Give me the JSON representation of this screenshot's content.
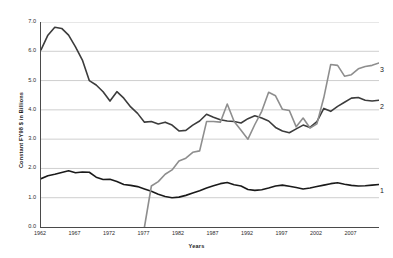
{
  "chart_data": {
    "type": "line",
    "title": "",
    "xlabel": "Years",
    "ylabel": "Constant FY98 $ in Billions",
    "xlim": [
      1962,
      2011
    ],
    "ylim": [
      0.0,
      7.0
    ],
    "grid": true,
    "legend_position": "right-inline-end-labels",
    "xticks": [
      "1962",
      "1967",
      "1972",
      "1977",
      "1982",
      "1987",
      "1992",
      "1997",
      "2002",
      "2007"
    ],
    "xtick_values": [
      1962,
      1967,
      1972,
      1977,
      1982,
      1987,
      1992,
      1997,
      2002,
      2007
    ],
    "yticks": [
      "0.0",
      "1.0",
      "2.0",
      "3.0",
      "4.0",
      "5.0",
      "6.0",
      "7.0"
    ],
    "ytick_values": [
      0.0,
      1.0,
      2.0,
      3.0,
      4.0,
      5.0,
      6.0,
      7.0
    ],
    "x": [
      1962,
      1963,
      1964,
      1965,
      1966,
      1967,
      1968,
      1969,
      1970,
      1971,
      1972,
      1973,
      1974,
      1975,
      1976,
      1977,
      1978,
      1979,
      1980,
      1981,
      1982,
      1983,
      1984,
      1985,
      1986,
      1987,
      1988,
      1989,
      1990,
      1991,
      1992,
      1993,
      1994,
      1995,
      1996,
      1997,
      1998,
      1999,
      2000,
      2001,
      2002,
      2003,
      2004,
      2005,
      2006,
      2007,
      2008,
      2009,
      2010,
      2011
    ],
    "series": [
      {
        "name": "1",
        "label": "1",
        "color": "#1a1a1a",
        "width": 1.6,
        "values": [
          1.65,
          1.75,
          1.8,
          1.86,
          1.92,
          1.85,
          1.88,
          1.87,
          1.7,
          1.62,
          1.63,
          1.55,
          1.45,
          1.42,
          1.38,
          1.3,
          1.22,
          1.12,
          1.04,
          1.0,
          1.02,
          1.08,
          1.16,
          1.24,
          1.33,
          1.41,
          1.48,
          1.52,
          1.44,
          1.4,
          1.28,
          1.25,
          1.27,
          1.33,
          1.4,
          1.43,
          1.39,
          1.35,
          1.3,
          1.33,
          1.38,
          1.43,
          1.48,
          1.51,
          1.46,
          1.42,
          1.4,
          1.41,
          1.43,
          1.45
        ]
      },
      {
        "name": "2",
        "label": "2",
        "color": "#3c3c3c",
        "width": 1.6,
        "values": [
          6.05,
          6.55,
          6.82,
          6.78,
          6.55,
          6.15,
          5.7,
          5.0,
          4.85,
          4.62,
          4.3,
          4.62,
          4.4,
          4.1,
          3.88,
          3.58,
          3.6,
          3.52,
          3.58,
          3.48,
          3.28,
          3.3,
          3.48,
          3.62,
          3.85,
          3.75,
          3.66,
          3.62,
          3.6,
          3.55,
          3.7,
          3.8,
          3.72,
          3.62,
          3.4,
          3.28,
          3.22,
          3.35,
          3.48,
          3.4,
          3.6,
          4.05,
          3.95,
          4.12,
          4.26,
          4.4,
          4.42,
          4.33,
          4.3,
          4.33
        ]
      },
      {
        "name": "3",
        "label": "3",
        "color": "#8e8e8e",
        "width": 1.6,
        "values": [
          null,
          null,
          null,
          null,
          null,
          null,
          null,
          null,
          null,
          null,
          null,
          null,
          null,
          null,
          null,
          0.0,
          1.4,
          1.55,
          1.8,
          1.95,
          2.25,
          2.35,
          2.55,
          2.6,
          3.6,
          3.6,
          3.58,
          4.2,
          3.6,
          3.3,
          3.0,
          3.5,
          3.95,
          4.6,
          4.48,
          4.02,
          3.98,
          3.42,
          3.72,
          3.38,
          3.52,
          4.42,
          5.55,
          5.52,
          5.15,
          5.2,
          5.4,
          5.48,
          5.52,
          5.6
        ]
      }
    ],
    "annotations": [
      {
        "text": "3",
        "x": 2011,
        "y": 5.35
      },
      {
        "text": "2",
        "x": 2011,
        "y": 4.1
      },
      {
        "text": "1",
        "x": 2011,
        "y": 1.22
      }
    ]
  }
}
